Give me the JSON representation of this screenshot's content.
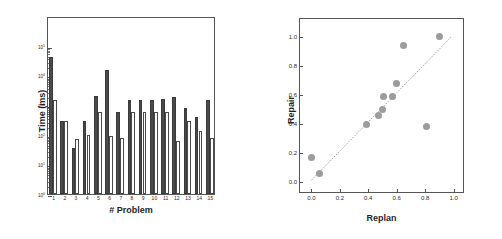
{
  "figure": {
    "background": "#ffffff",
    "panels": [
      "bar-chart",
      "scatter-plot"
    ]
  },
  "chart_data": [
    {
      "type": "bar",
      "title": "",
      "xlabel": "# Problem",
      "ylabel": "Time (ms)",
      "categories": [
        "1",
        "2",
        "3",
        "4",
        "5",
        "6",
        "7",
        "8",
        "9",
        "10",
        "11",
        "12",
        "13",
        "14",
        "15"
      ],
      "yscale": "log",
      "ylim": [
        1,
        1000000
      ],
      "ytick_labels": [
        "10",
        "10",
        "10",
        "10",
        "10",
        "10"
      ],
      "ytick_exponents": [
        "0",
        "1",
        "2",
        "3",
        "4",
        "5"
      ],
      "ytick_values": [
        1,
        10,
        100,
        1000,
        10000,
        100000
      ],
      "grid": false,
      "legend": "none",
      "series": [
        {
          "name": "dark-bars",
          "color": "#4a4a4a",
          "values": [
            40000,
            300,
            35,
            300,
            2000,
            15000,
            600,
            1500,
            1500,
            1500,
            1600,
            1800,
            800,
            400,
            1500
          ]
        },
        {
          "name": "light-bars",
          "color": "#ffffff",
          "edgecolor": "#4a4a4a",
          "values": [
            1500,
            280,
            70,
            95,
            600,
            90,
            80,
            600,
            600,
            600,
            600,
            60,
            300,
            130,
            75
          ]
        }
      ]
    },
    {
      "type": "scatter",
      "title": "",
      "xlabel": "Replan",
      "ylabel": "Repair",
      "xlim": [
        -0.08,
        1.08
      ],
      "ylim": [
        -0.08,
        1.12
      ],
      "xtick_labels": [
        "0.0",
        "0.2",
        "0.4",
        "0.6",
        "0.8",
        "1.0"
      ],
      "xtick_values": [
        0.0,
        0.2,
        0.4,
        0.6,
        0.8,
        1.0
      ],
      "ytick_labels": [
        "0.0",
        "0.2",
        "0.4",
        "0.6",
        "0.8",
        "1.0"
      ],
      "ytick_values": [
        0.0,
        0.2,
        0.4,
        0.6,
        0.8,
        1.0
      ],
      "grid": false,
      "legend": "none",
      "marker_color": "#9c9c9c",
      "points": [
        {
          "x": 0.0,
          "y": 0.17
        },
        {
          "x": 0.06,
          "y": 0.06
        },
        {
          "x": 0.39,
          "y": 0.4
        },
        {
          "x": 0.47,
          "y": 0.46
        },
        {
          "x": 0.5,
          "y": 0.5
        },
        {
          "x": 0.51,
          "y": 0.59
        },
        {
          "x": 0.57,
          "y": 0.59
        },
        {
          "x": 0.6,
          "y": 0.68
        },
        {
          "x": 0.65,
          "y": 0.94
        },
        {
          "x": 0.81,
          "y": 0.38
        },
        {
          "x": 0.9,
          "y": 1.0
        }
      ],
      "reference_line": {
        "style": "dotted",
        "color": "#9c9c9c",
        "x0": 0.0,
        "y0": 0.0,
        "x1": 1.0,
        "y1": 1.0
      }
    }
  ]
}
